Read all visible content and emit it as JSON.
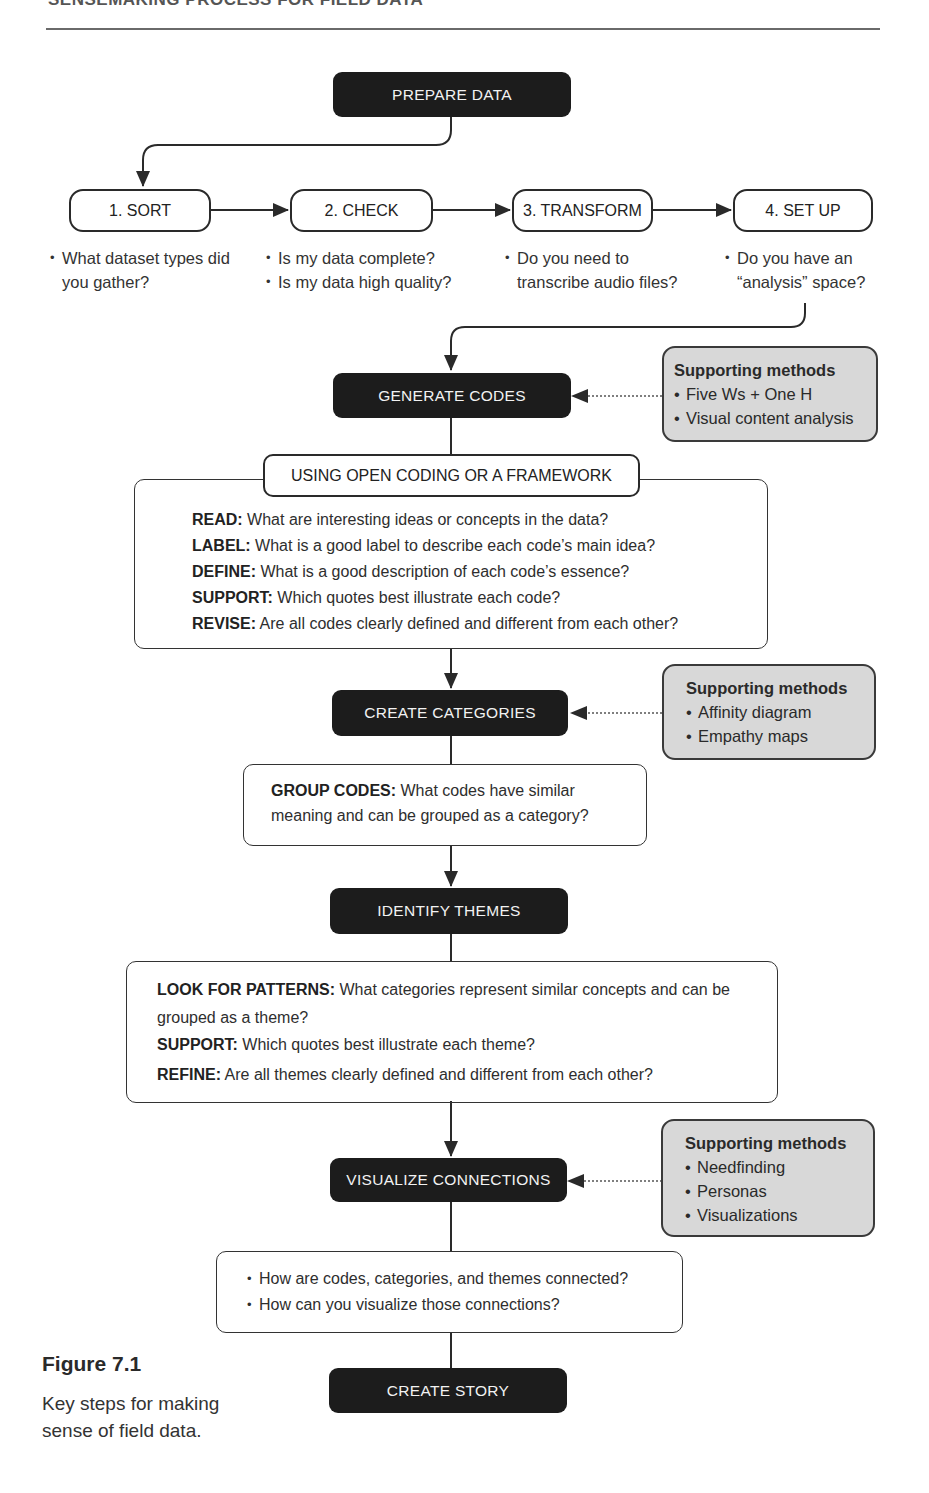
{
  "header": {
    "title": "SENSEMAKING PROCESS FOR FIELD DATA"
  },
  "prepare": {
    "label": "PREPARE DATA"
  },
  "steps": [
    {
      "label": "1. SORT",
      "questions": [
        "What dataset types did you gather?"
      ]
    },
    {
      "label": "2. CHECK",
      "questions": [
        "Is my data complete?",
        "Is my data high quality?"
      ]
    },
    {
      "label": "3. TRANSFORM",
      "questions": [
        "Do you need to transcribe audio files?"
      ]
    },
    {
      "label": "4. SET UP",
      "questions": [
        "Do you have an “analysis” space?"
      ]
    }
  ],
  "generate_codes": {
    "label": "GENERATE CODES",
    "subheading": "USING OPEN CODING OR A FRAMEWORK",
    "items": [
      {
        "term": "READ:",
        "text": " What are interesting ideas or concepts in the data?"
      },
      {
        "term": "LABEL:",
        "text": "  What is a good label to describe each code’s main idea?"
      },
      {
        "term": "DEFINE:",
        "text": "  What is a good description of each code’s essence?"
      },
      {
        "term": "SUPPORT:",
        "text": "  Which quotes best illustrate each code?"
      },
      {
        "term": "REVISE:",
        "text": " Are all codes clearly defined and different from each other?"
      }
    ],
    "supporting": {
      "title": "Supporting methods",
      "items": [
        "Five Ws + One H",
        "Visual content analysis"
      ]
    }
  },
  "create_categories": {
    "label": "CREATE CATEGORIES",
    "items": [
      {
        "term": "GROUP CODES:",
        "text": " What codes have similar meaning and can be grouped as a category?"
      }
    ],
    "supporting": {
      "title": "Supporting methods",
      "items": [
        "Affinity diagram",
        "Empathy maps"
      ]
    }
  },
  "identify_themes": {
    "label": "IDENTIFY THEMES",
    "items": [
      {
        "term": "LOOK FOR PATTERNS:",
        "text": " What categories represent similar concepts and can be grouped as a theme?"
      },
      {
        "term": "SUPPORT:",
        "text": " Which quotes best illustrate each theme?"
      },
      {
        "term": "REFINE:",
        "text": " Are all themes clearly defined and different from each other?"
      }
    ]
  },
  "visualize_connections": {
    "label": "VISUALIZE CONNECTIONS",
    "questions": [
      "How are codes, categories, and themes connected?",
      "How can you visualize those connections?"
    ],
    "supporting": {
      "title": "Supporting methods",
      "items": [
        "Needfinding",
        "Personas",
        "Visualizations"
      ]
    }
  },
  "create_story": {
    "label": "CREATE STORY"
  },
  "figure": {
    "number": "Figure 7.1",
    "caption": "Key steps for making sense of field data."
  },
  "colors": {
    "dark_box": "#1c1c1c",
    "support_box": "#d8d8d8",
    "line": "#2a2a2a"
  }
}
